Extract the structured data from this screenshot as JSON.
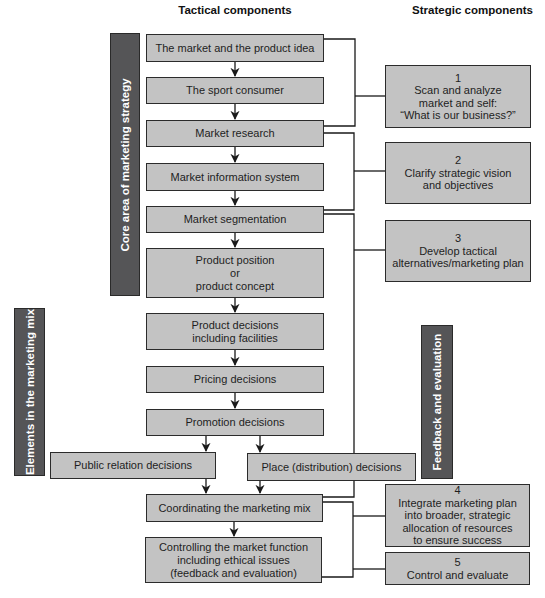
{
  "headers": {
    "tactical": "Tactical components",
    "strategic": "Strategic components"
  },
  "side_labels": {
    "core": "Core area of marketing strategy",
    "elements": "Elements in the marketing mix",
    "feedback": "Feedback and evaluation"
  },
  "tactical_boxes": [
    {
      "id": "market-product-idea",
      "label": "The market and the product idea"
    },
    {
      "id": "sport-consumer",
      "label": "The sport consumer"
    },
    {
      "id": "market-research",
      "label": "Market research"
    },
    {
      "id": "market-information-system",
      "label": "Market information system"
    },
    {
      "id": "market-segmentation",
      "label": "Market segmentation"
    },
    {
      "id": "product-position",
      "label": "Product position\nor\nproduct concept"
    },
    {
      "id": "product-decisions",
      "label": "Product decisions\nincluding facilities"
    },
    {
      "id": "pricing-decisions",
      "label": "Pricing decisions"
    },
    {
      "id": "promotion-decisions",
      "label": "Promotion decisions"
    },
    {
      "id": "public-relation-decisions",
      "label": "Public relation decisions"
    },
    {
      "id": "place-decisions",
      "label": "Place (distribution) decisions"
    },
    {
      "id": "coordinating-mix",
      "label": "Coordinating the marketing mix"
    },
    {
      "id": "controlling-market-function",
      "label": "Controlling the market function\nincluding ethical issues\n(feedback and evaluation)"
    }
  ],
  "strategic_boxes": [
    {
      "number": "1",
      "label": "1\nScan and analyze\nmarket and self:\n“What is our business?”"
    },
    {
      "number": "2",
      "label": "2\nClarify strategic vision\nand objectives"
    },
    {
      "number": "3",
      "label": "3\nDevelop tactical\nalternatives/marketing plan"
    },
    {
      "number": "4",
      "label": "4\nIntegrate marketing plan\ninto broader, strategic\nallocation of resources\nto ensure success"
    },
    {
      "number": "5",
      "label": "5\nControl and evaluate"
    }
  ],
  "colors": {
    "box_fill": "#c3c3c3",
    "box_border": "#2b2b2b",
    "label_bar_fill": "#555557",
    "label_bar_text": "#ffffff",
    "line": "#1a1a1a"
  }
}
